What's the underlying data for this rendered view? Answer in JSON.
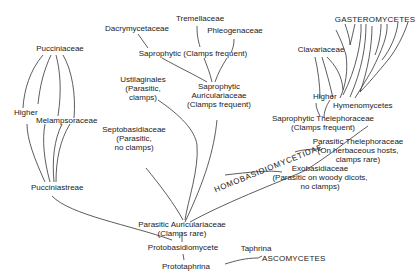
{
  "diagram": {
    "line_color": "#333333",
    "text_color": "#222222",
    "background": "#ffffff"
  },
  "labels": {
    "pucciniaceae": "Pucciniaceae",
    "higher_left": "Higher",
    "melampsoraceae": "Melampsoraceae",
    "pucciniastreae": "Pucciniastreae",
    "dacrymycetaceae": "Dacrymycetaceae",
    "tremellaceae": "Tremellaceae",
    "phleogenaceae": "Phleogenaceae",
    "saprophytic_clamps": "Saprophytic (Clamps frequent)",
    "ustilaginales": [
      "Ustilaginales",
      "(Parasitic,",
      "clamps)"
    ],
    "saprophytic_auriculariaceae": [
      "Saprophytic",
      "Auriculariaceae",
      "(Clamps frequent)"
    ],
    "septobasidiaceae": [
      "Septobasidiaceae",
      "(Parasitic,",
      "no clamps)"
    ],
    "parasitic_auriculariaceae": [
      "Parasitic Auriculariaceae",
      "(Clamps rare)"
    ],
    "protobasidiomycete": "Protobasidiomycete",
    "prototaphrina": "Prototaphrina",
    "taphrina": "Taphrina",
    "ascomycetes": "ASCOMYCETES",
    "gasteromycetes": "GASTEROMYCETES",
    "clavariaceae": "Clavariaceae",
    "higher_right": "Higher",
    "hymenomycetes": "Hymenomycetes",
    "saprophytic_thelephoraceae": [
      "Saprophytic Thelephoraceae",
      "(Clamps frequent)"
    ],
    "homobasidiomycetidae": "HOMOBASIDIOMYCETIDAE",
    "parasitic_thelephoraceae": [
      "Parasitic Thelephoraceae",
      "(On herbaceous hosts,",
      "clamps rare)"
    ],
    "exobasidiaceae": [
      "Exobasidiaceae",
      "(Parasitic on woody dicots,",
      "no clamps)"
    ]
  }
}
